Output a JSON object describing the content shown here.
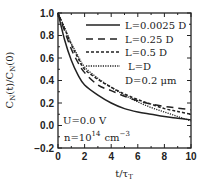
{
  "chart_data": {
    "type": "line",
    "title": "",
    "xlabel": "t/τ_T",
    "ylabel": "C_N(t)/C_N(0)",
    "xlim": [
      0,
      10
    ],
    "ylim": [
      -0.2,
      1.0
    ],
    "xticks": [
      "0",
      "2",
      "4",
      "6",
      "8",
      "10"
    ],
    "yticks": [
      "1.0",
      "0.8",
      "0.6",
      "0.4",
      "0.2",
      "0.0",
      "-0.2"
    ],
    "grid": false,
    "legend_position": "upper right",
    "x": [
      0,
      0.5,
      1,
      1.5,
      2,
      3,
      4,
      5,
      6,
      7,
      8,
      9,
      10
    ],
    "series": [
      {
        "name": "L=0.0025 D",
        "style": "solid",
        "values": [
          1.0,
          0.76,
          0.58,
          0.45,
          0.36,
          0.27,
          0.2,
          0.15,
          0.12,
          0.1,
          0.08,
          0.065,
          0.05
        ]
      },
      {
        "name": "L=0.25 D",
        "style": "dashed",
        "values": [
          1.0,
          0.84,
          0.68,
          0.56,
          0.47,
          0.36,
          0.31,
          0.26,
          0.22,
          0.19,
          0.17,
          0.155,
          0.14
        ]
      },
      {
        "name": "L=0.5 D",
        "style": "short-dashed",
        "values": [
          1.0,
          0.86,
          0.72,
          0.6,
          0.5,
          0.41,
          0.34,
          0.28,
          0.23,
          0.19,
          0.15,
          0.125,
          0.1
        ]
      },
      {
        "name": "L=D",
        "style": "dotted",
        "values": [
          1.0,
          0.87,
          0.73,
          0.62,
          0.52,
          0.42,
          0.34,
          0.27,
          0.21,
          0.16,
          0.12,
          0.08,
          0.04
        ]
      }
    ],
    "annotations": [
      "D=0.2 μm",
      "U=0.0 V",
      "n=10^14 cm^-3"
    ]
  },
  "labels": {
    "ylabel_main": "C",
    "ylabel_sub1": "N",
    "ylabel_mid": "(t)/C",
    "ylabel_sub2": "N",
    "ylabel_end": "(0)",
    "xlabel_main": "t/τ",
    "xlabel_sub": "T",
    "legend": [
      "L=0.0025 D",
      "L=0.25 D",
      "L=0.5 D",
      "L=D"
    ],
    "note_d": "D=0.2 μm",
    "note_u": "U=0.0 V",
    "note_n_pre": "n=10",
    "note_n_exp": "14",
    "note_n_unit": "cm",
    "note_n_unit_exp": "−3"
  }
}
